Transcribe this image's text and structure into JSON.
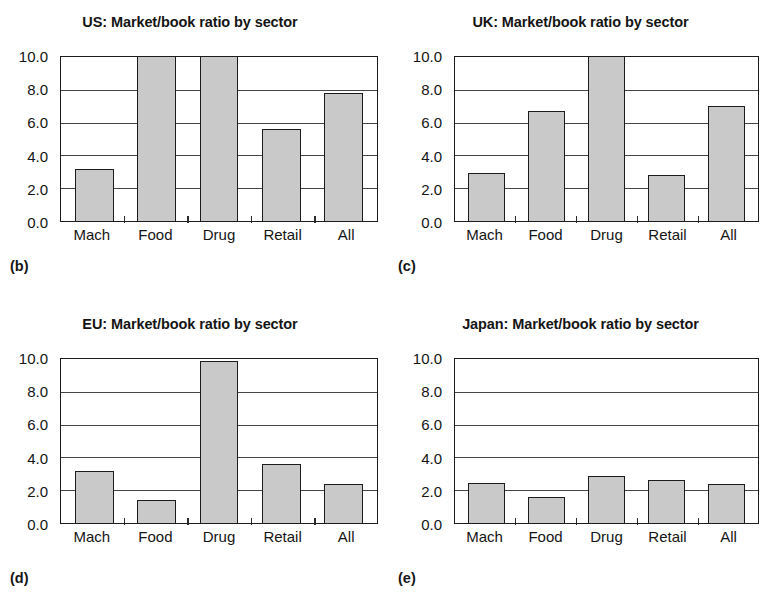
{
  "figure": {
    "shared_categories": [
      "Mach",
      "Food",
      "Drug",
      "Retail",
      "All"
    ],
    "y_ticks": [
      "0.0",
      "2.0",
      "4.0",
      "6.0",
      "8.0",
      "10.0"
    ],
    "y_min": 0,
    "y_max": 10,
    "bar_fill_color": "#c9c9c9",
    "bar_border_color": "#1c1c1c",
    "background_color": "#ffffff"
  },
  "panels": [
    {
      "letter": "(b)",
      "title": "US: Market/book ratio by sector",
      "values": [
        3.2,
        10.0,
        10.0,
        5.6,
        7.8
      ]
    },
    {
      "letter": "(c)",
      "title": "UK: Market/book ratio by sector",
      "values": [
        2.9,
        6.7,
        10.0,
        2.8,
        7.0
      ]
    },
    {
      "letter": "(d)",
      "title": "EU: Market/book ratio by sector",
      "values": [
        3.2,
        1.4,
        9.9,
        3.6,
        2.35
      ]
    },
    {
      "letter": "(e)",
      "title": "Japan: Market/book ratio by sector",
      "values": [
        2.45,
        1.6,
        2.85,
        2.65,
        2.35
      ]
    }
  ],
  "chart_data": [
    {
      "type": "bar",
      "title": "US: Market/book ratio by sector",
      "panel_label": "(b)",
      "categories": [
        "Mach",
        "Food",
        "Drug",
        "Retail",
        "All"
      ],
      "values": [
        3.2,
        10.0,
        10.0,
        5.6,
        7.8
      ],
      "xlabel": "",
      "ylabel": "",
      "ylim": [
        0,
        10
      ],
      "yticks": [
        0.0,
        2.0,
        4.0,
        6.0,
        8.0,
        10.0
      ],
      "grid": "horizontal",
      "legend": "none",
      "notes": "Food and Drug bars reach the top of the axis (clipped at 10.0)"
    },
    {
      "type": "bar",
      "title": "UK: Market/book ratio by sector",
      "panel_label": "(c)",
      "categories": [
        "Mach",
        "Food",
        "Drug",
        "Retail",
        "All"
      ],
      "values": [
        2.9,
        6.7,
        10.0,
        2.8,
        7.0
      ],
      "xlabel": "",
      "ylabel": "",
      "ylim": [
        0,
        10
      ],
      "yticks": [
        0.0,
        2.0,
        4.0,
        6.0,
        8.0,
        10.0
      ],
      "grid": "horizontal",
      "legend": "none",
      "notes": "Drug bar reaches the top of the axis (clipped at 10.0)"
    },
    {
      "type": "bar",
      "title": "EU: Market/book ratio by sector",
      "panel_label": "(d)",
      "categories": [
        "Mach",
        "Food",
        "Drug",
        "Retail",
        "All"
      ],
      "values": [
        3.2,
        1.4,
        9.9,
        3.6,
        2.35
      ],
      "xlabel": "",
      "ylabel": "",
      "ylim": [
        0,
        10
      ],
      "yticks": [
        0.0,
        2.0,
        4.0,
        6.0,
        8.0,
        10.0
      ],
      "grid": "horizontal",
      "legend": "none"
    },
    {
      "type": "bar",
      "title": "Japan: Market/book ratio by sector",
      "panel_label": "(e)",
      "categories": [
        "Mach",
        "Food",
        "Drug",
        "Retail",
        "All"
      ],
      "values": [
        2.45,
        1.6,
        2.85,
        2.65,
        2.35
      ],
      "xlabel": "",
      "ylabel": "",
      "ylim": [
        0,
        10
      ],
      "yticks": [
        0.0,
        2.0,
        4.0,
        6.0,
        8.0,
        10.0
      ],
      "grid": "horizontal",
      "legend": "none"
    }
  ]
}
